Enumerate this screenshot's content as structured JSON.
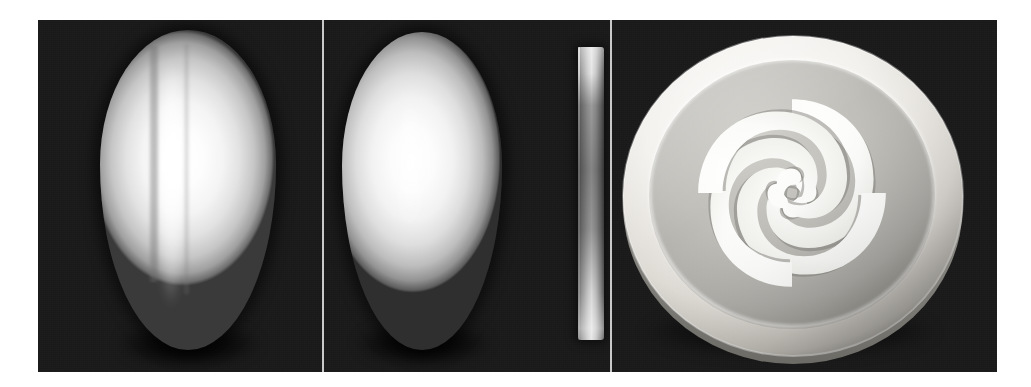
{
  "figure": {
    "caption": "",
    "background_color": "#ffffff",
    "plate_background_color": "#1b1b1b",
    "divider_color": "#c9c9c9",
    "panel_count": 3
  },
  "panels": [
    {
      "id": "panel-a",
      "label": "",
      "subject": "white ellipsoid egg-shaped object, vertical orientation, with a faint vertical seam groove running down the centre",
      "object_name": "seamed-ellipsoid",
      "object_color": "#f6f6f6",
      "shadow_color": "#000000"
    },
    {
      "id": "panel-b",
      "label": "",
      "subject": "smooth white ellipsoid egg-shaped object beside a thin tall grey rectangular bar",
      "object_name": "smooth-ellipsoid",
      "secondary_object_name": "vertical-bar",
      "object_color": "#f4f4f4",
      "bar_color": "#b9b9b9"
    },
    {
      "id": "panel-c",
      "label": "",
      "subject": "circular disc with four-fold rotationally symmetric comma (tomoe) shaped through-cut openings",
      "object_name": "tomoe-disc",
      "disc_rim_color": "#e8e6e2",
      "disc_face_color": "#b8b8b4",
      "cutout_color": "#fbfbfa",
      "cutout_count": 4,
      "symmetry": "4-fold rotational"
    }
  ],
  "colors": {
    "highlight": "#ffffff",
    "midtone": "#c6c6c6",
    "shade": "#6f6f6f",
    "backdrop": "#1b1b1b"
  }
}
